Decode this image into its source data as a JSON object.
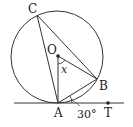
{
  "diagram": {
    "type": "circle-tangent-geometry",
    "points": {
      "C": {
        "label": "C"
      },
      "O": {
        "label": "O"
      },
      "B": {
        "label": "B"
      },
      "A": {
        "label": "A"
      },
      "T": {
        "label": "T"
      }
    },
    "angle_labels": {
      "x": "x",
      "tangent_angle": "30°"
    },
    "colors": {
      "stroke": "#333333",
      "text": "#222222"
    }
  }
}
